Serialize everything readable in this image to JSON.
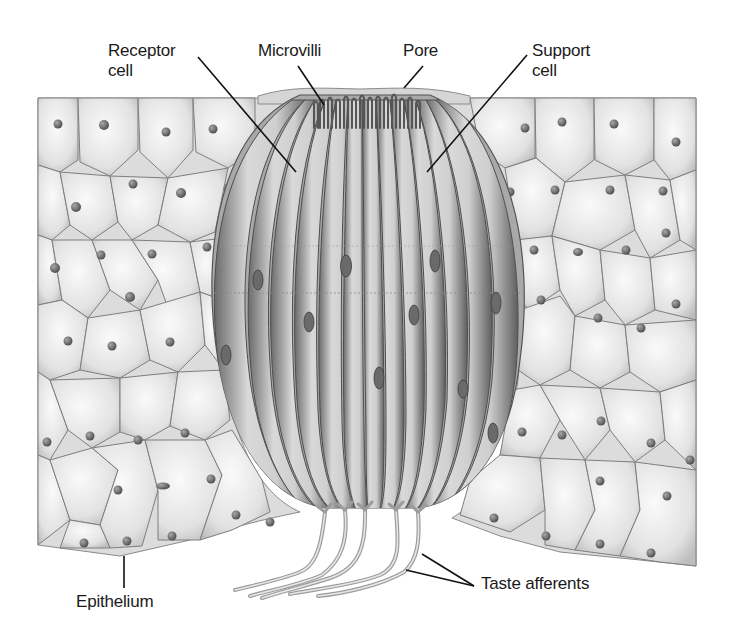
{
  "figure": {
    "background": "#ffffff",
    "colors": {
      "cell_fill": "#ececec",
      "cell_edge": "#7a7a7a",
      "nucleus": "#6e6e6e",
      "bud_fill": "#bdbdbd",
      "bud_strand_dark": "#5a5a5a",
      "afferent": "#c8c8c8",
      "leader_line": "#111111",
      "text": "#1a1a1a"
    }
  },
  "labels": [
    {
      "id": "receptor-cell",
      "text": "Receptor\ncell",
      "x": 108,
      "y": 41,
      "pointer": [
        [
          198,
          57
        ],
        [
          296,
          172
        ]
      ]
    },
    {
      "id": "microvilli",
      "text": "Microvilli",
      "x": 258,
      "y": 41,
      "pointer": [
        [
          298,
          66
        ],
        [
          324,
          105
        ]
      ]
    },
    {
      "id": "pore",
      "text": "Pore",
      "x": 403,
      "y": 41,
      "pointer": [
        [
          423,
          66
        ],
        [
          404,
          88
        ]
      ]
    },
    {
      "id": "support-cell",
      "text": "Support\ncell",
      "x": 532,
      "y": 41,
      "pointer": [
        [
          527,
          55
        ],
        [
          427,
          172
        ]
      ]
    },
    {
      "id": "epithelium",
      "text": "Epithelium",
      "x": 76,
      "y": 592,
      "pointer": [
        [
          124,
          588
        ],
        [
          124,
          556
        ]
      ]
    },
    {
      "id": "taste-afferents",
      "text": "Taste afferents",
      "x": 481,
      "y": 574,
      "pointers": [
        [
          [
            474,
            586
          ],
          [
            422,
            554
          ]
        ],
        [
          [
            474,
            586
          ],
          [
            406,
            570
          ]
        ]
      ]
    }
  ]
}
